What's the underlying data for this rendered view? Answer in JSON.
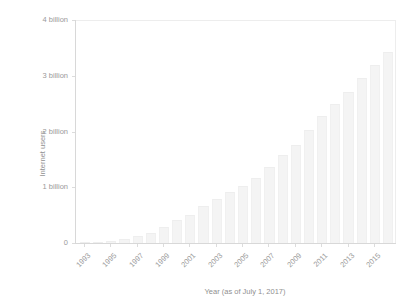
{
  "chart_data": {
    "type": "bar",
    "title": "",
    "subtitle": "",
    "xlabel": "Year (as of July 1, 2017)",
    "ylabel": "Internet users",
    "categories": [
      1993,
      1994,
      1995,
      1996,
      1997,
      1998,
      1999,
      2000,
      2001,
      2002,
      2003,
      2004,
      2005,
      2006,
      2007,
      2008,
      2009,
      2010,
      2011,
      2012,
      2013,
      2014,
      2015,
      2016
    ],
    "values": [
      0.014,
      0.025,
      0.04,
      0.077,
      0.12,
      0.188,
      0.281,
      0.414,
      0.502,
      0.665,
      0.781,
      0.913,
      1.024,
      1.16,
      1.37,
      1.57,
      1.75,
      2.02,
      2.27,
      2.49,
      2.71,
      2.96,
      3.19,
      3.42
    ],
    "value_unit": "billion",
    "ylim": [
      0,
      4
    ],
    "xlim": [
      1992.4,
      2016.6
    ],
    "ytick_values": [
      0,
      1,
      2,
      3,
      4
    ],
    "ytick_labels": [
      "0",
      "1 billion",
      "2 billion",
      "3 billion",
      "4 billion"
    ],
    "xtick_values": [
      1993,
      1995,
      1997,
      1999,
      2001,
      2003,
      2005,
      2007,
      2009,
      2011,
      2013,
      2015
    ],
    "xtick_labels": [
      "1993",
      "1995",
      "1997",
      "1999",
      "2001",
      "2003",
      "2005",
      "2007",
      "2009",
      "2011",
      "2013",
      "2015"
    ],
    "grid": false,
    "legend": null,
    "legend_position": "none",
    "series": [
      {
        "name": "Internet users",
        "values": [
          0.014,
          0.025,
          0.04,
          0.077,
          0.12,
          0.188,
          0.281,
          0.414,
          0.502,
          0.665,
          0.781,
          0.913,
          1.024,
          1.16,
          1.37,
          1.57,
          1.75,
          2.02,
          2.27,
          2.49,
          2.71,
          2.96,
          3.19,
          3.42
        ]
      }
    ],
    "colors": {
      "bar_fill": "#f4f4f4",
      "bar_edge": "#f0f0f0",
      "axis": "#d8d8d8",
      "frame": "#ededed",
      "tick_text": "#9a9a9a",
      "axis_title": "#8f8f8f",
      "background": "#ffffff"
    }
  }
}
